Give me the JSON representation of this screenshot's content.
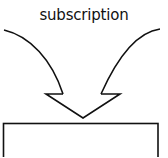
{
  "diagram": {
    "label": "subscription",
    "stroke_color": "#111111",
    "background": "#ffffff",
    "shapes": [
      {
        "type": "curved-arrow-left-shaft"
      },
      {
        "type": "curved-arrow-right-shaft"
      },
      {
        "type": "arrow-head",
        "points_down": true
      },
      {
        "type": "box",
        "partially_visible": true
      }
    ]
  }
}
